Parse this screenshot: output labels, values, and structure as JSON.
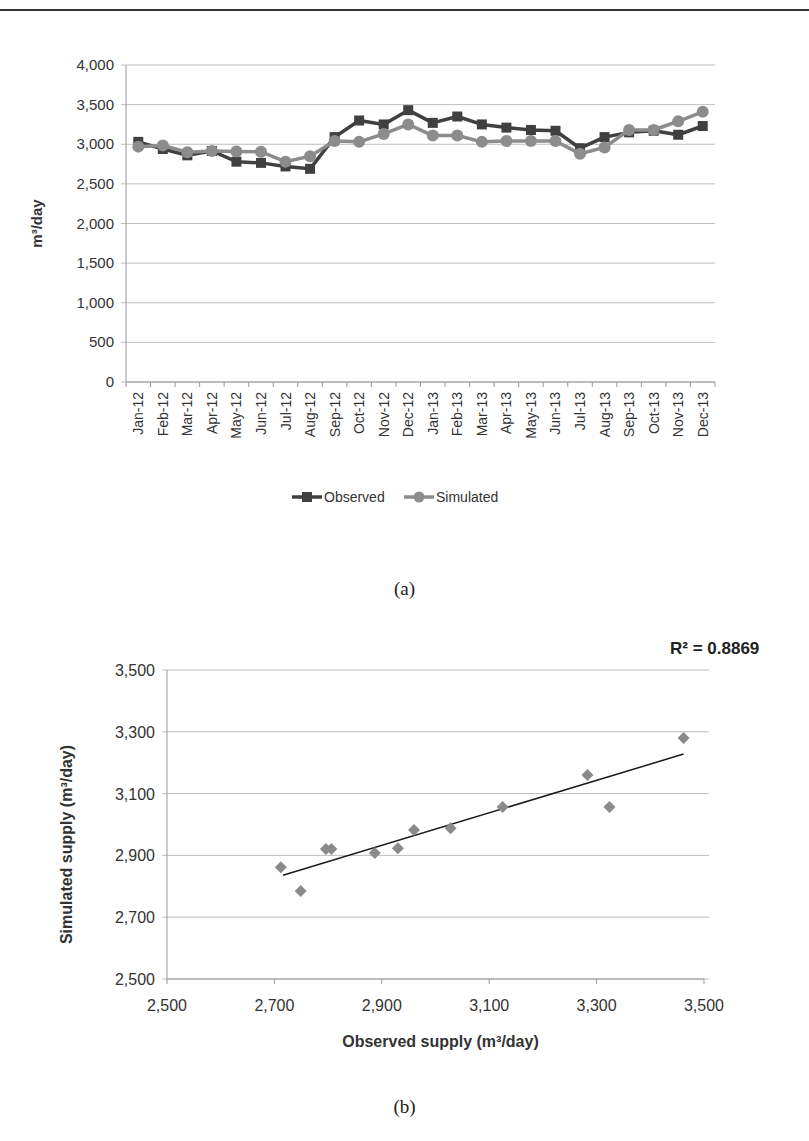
{
  "captions": {
    "a": "(a)",
    "b": "(b)"
  },
  "colors": {
    "observed": "#404040",
    "simulated": "#8c8c8c",
    "grid": "#bdbdbd",
    "axis": "#9a9a9a",
    "trendline": "#1a1a1a",
    "text": "#333333"
  },
  "chart_data": [
    {
      "type": "line",
      "title": "",
      "xlabel": "",
      "ylabel": "m³/day",
      "ylim": [
        0,
        4000
      ],
      "yticks": [
        0,
        500,
        1000,
        1500,
        2000,
        2500,
        3000,
        3500,
        4000
      ],
      "ytick_labels": [
        "0",
        "500",
        "1,000",
        "1,500",
        "2,000",
        "2,500",
        "3,000",
        "3,500",
        "4,000"
      ],
      "grid": true,
      "legend_position": "bottom",
      "categories": [
        "Jan-12",
        "Feb-12",
        "Mar-12",
        "Apr-12",
        "May-12",
        "Jun-12",
        "Jul-12",
        "Aug-12",
        "Sep-12",
        "Oct-12",
        "Nov-12",
        "Dec-12",
        "Jan-13",
        "Feb-13",
        "Mar-13",
        "Apr-13",
        "May-13",
        "Jun-13",
        "Jul-13",
        "Aug-13",
        "Sep-13",
        "Oct-13",
        "Nov-13",
        "Dec-13"
      ],
      "series": [
        {
          "name": "Observed",
          "marker": "square",
          "values": [
            3030,
            2940,
            2860,
            2915,
            2780,
            2765,
            2720,
            2690,
            3090,
            3300,
            3250,
            3430,
            3270,
            3350,
            3250,
            3210,
            3180,
            3170,
            2950,
            3090,
            3150,
            3170,
            3120,
            3230
          ]
        },
        {
          "name": "Simulated",
          "marker": "circle",
          "values": [
            2970,
            2985,
            2900,
            2915,
            2910,
            2905,
            2780,
            2850,
            3040,
            3030,
            3130,
            3250,
            3110,
            3110,
            3030,
            3040,
            3040,
            3040,
            2880,
            2960,
            3180,
            3180,
            3290,
            3410
          ]
        }
      ]
    },
    {
      "type": "scatter",
      "title": "",
      "xlabel": "Observed supply (m³/day)",
      "ylabel": "Simulated supply (m³/day)",
      "xlim": [
        2500,
        3500
      ],
      "ylim": [
        2500,
        3500
      ],
      "xticks": [
        2500,
        2700,
        2900,
        3100,
        3300,
        3500
      ],
      "xtick_labels": [
        "2,500",
        "2,700",
        "2,900",
        "3,100",
        "3,300",
        "3,500"
      ],
      "yticks": [
        2500,
        2700,
        2900,
        3100,
        3300,
        3500
      ],
      "ytick_labels": [
        "2,500",
        "2,700",
        "2,900",
        "3,100",
        "3,300",
        "3,500"
      ],
      "grid": true,
      "annotation": "R² = 0.8869",
      "trendline": {
        "x": [
          2716,
          3462
        ],
        "y": [
          2836,
          3228
        ]
      },
      "points": [
        {
          "x": 2712,
          "y": 2862
        },
        {
          "x": 2749,
          "y": 2785
        },
        {
          "x": 2796,
          "y": 2921
        },
        {
          "x": 2806,
          "y": 2921
        },
        {
          "x": 2887,
          "y": 2908
        },
        {
          "x": 2930,
          "y": 2923
        },
        {
          "x": 2960,
          "y": 2982
        },
        {
          "x": 3028,
          "y": 2988
        },
        {
          "x": 3125,
          "y": 3057
        },
        {
          "x": 3283,
          "y": 3160
        },
        {
          "x": 3324,
          "y": 3057
        },
        {
          "x": 3462,
          "y": 3280
        }
      ]
    }
  ]
}
